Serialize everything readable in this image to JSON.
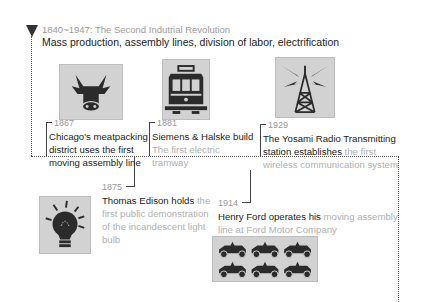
{
  "header": {
    "period": "1840~1947: The Second Indutrial Revolution",
    "summary": "Mass production, assembly lines, division of labor, electrification"
  },
  "events": [
    {
      "year": "1867",
      "icon": "cow-icon",
      "text_dark": "Chicago's meatpacking district uses the first moving assembly line",
      "text_light": ""
    },
    {
      "year": "1881",
      "icon": "tram-icon",
      "text_dark": "Siemens & Halske build",
      "text_light": "The first electric tramway"
    },
    {
      "year": "1929",
      "icon": "radio-tower-icon",
      "text_dark": "The Yosami Radio Transmitting station establishes",
      "text_light": "the first wireless communication system"
    },
    {
      "year": "1875",
      "icon": "light-bulb-icon",
      "text_dark": "Thomas Edison holds",
      "text_light": "the first public demonstration of the incandescent light bulb"
    },
    {
      "year": "1914",
      "icon": "cars-icon",
      "text_dark": "Henry Ford operates his",
      "text_light": "moving assembly line at Ford Motor Company"
    }
  ],
  "colors": {
    "line": "#555555",
    "icon_bg": "#d2d2d2",
    "icon_fg": "#2b2b2b",
    "muted_text": "#b0b0b0"
  }
}
